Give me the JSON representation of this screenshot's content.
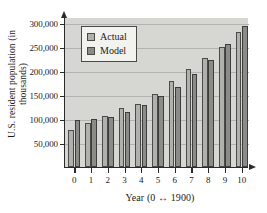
{
  "chart_data": {
    "type": "bar",
    "title": "",
    "xlabel": "Year (0 ↔ 1900)",
    "ylabel": "U.S. resident population (in thousands)",
    "categories": [
      "0",
      "1",
      "2",
      "3",
      "4",
      "5",
      "6",
      "7",
      "8",
      "9",
      "10"
    ],
    "series": [
      {
        "name": "Actual",
        "color": "#b0b0ac",
        "values": [
          77000,
          92000,
          106000,
          123000,
          132000,
          151000,
          179000,
          203000,
          227000,
          249000,
          281000
        ]
      },
      {
        "name": "Model",
        "color": "#8b8b88",
        "values": [
          98000,
          100000,
          105000,
          115000,
          129000,
          147000,
          167000,
          193000,
          223000,
          256000,
          294000
        ]
      }
    ],
    "ylim": [
      0,
      312000
    ],
    "yticks": [
      50000,
      100000,
      150000,
      200000,
      250000,
      300000
    ],
    "ytick_labels": [
      "50,000",
      "100,000",
      "150,000",
      "200,000",
      "250,000",
      "300,000"
    ],
    "grid": true,
    "legend_position": "top-left",
    "legend_entries": [
      "Actual",
      "Model"
    ]
  }
}
